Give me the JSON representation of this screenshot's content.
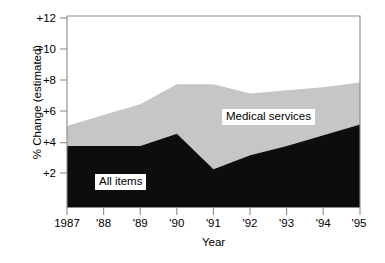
{
  "axes": {
    "ylabel": "% Change (estimated)",
    "xlabel": "Year",
    "yticks": [
      "+12",
      "+10",
      "+8",
      "+6",
      "+4",
      "+2"
    ],
    "xticks": [
      "1987",
      "'88",
      "'89",
      "'90",
      "'91",
      "'92",
      "'93",
      "'94",
      "'95"
    ]
  },
  "labels": {
    "medical_services": "Medical services",
    "all_items": "All items"
  },
  "colors": {
    "all_items_fill": "#0d0d0d",
    "medical_services_fill": "#c6c6c6",
    "axis": "#8c8c8c",
    "text": "#000000",
    "plot_background": "#ffffff"
  },
  "chart_data": {
    "type": "area",
    "stacked": true,
    "title": "",
    "subtitle": "",
    "xlabel": "Year",
    "ylabel": "% Change (estimated)",
    "xlim": [
      1987,
      1995
    ],
    "ylim": [
      0,
      12
    ],
    "ytick_values": [
      12,
      10,
      8,
      6,
      4,
      2
    ],
    "ytick_labels": [
      "+12",
      "+10",
      "+8",
      "+6",
      "+4",
      "+2"
    ],
    "xtick_values": [
      1987,
      1988,
      1989,
      1990,
      1991,
      1992,
      1993,
      1994,
      1995
    ],
    "xtick_labels": [
      "1987",
      "'88",
      "'89",
      "'90",
      "'91",
      "'92",
      "'93",
      "'94",
      "'95"
    ],
    "grid": false,
    "legend": "inline-annotations",
    "x": [
      1987,
      1988,
      1989,
      1990,
      1991,
      1992,
      1993,
      1994,
      1995
    ],
    "series": [
      {
        "name": "All items",
        "stack_order": 1,
        "color": "#0d0d0d",
        "values": [
          4.0,
          4.0,
          4.0,
          4.8,
          2.5,
          3.4,
          4.0,
          4.7,
          5.4
        ]
      },
      {
        "name": "Medical services",
        "stack_order": 2,
        "color": "#c6c6c6",
        "values": [
          1.3,
          2.0,
          2.7,
          3.2,
          5.5,
          4.0,
          3.6,
          3.1,
          2.7
        ]
      }
    ],
    "cumulative_top": [
      5.3,
      6.0,
      6.7,
      8.0,
      8.0,
      7.4,
      7.6,
      7.8,
      8.1
    ]
  },
  "geometry": {
    "plot_left": 67,
    "plot_right": 360,
    "plot_top": 16,
    "plot_bottom": 208,
    "y_value_at_top": 12.4,
    "y_value_at_bottom": -0.0
  }
}
